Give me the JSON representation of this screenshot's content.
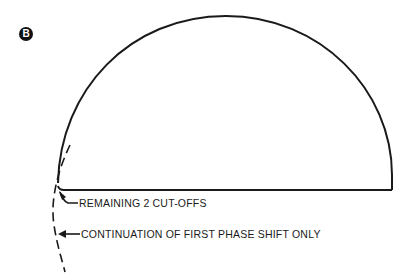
{
  "figure": {
    "panel_label": "B",
    "labels": {
      "remaining_cutoffs": "REMAINING 2  CUT-OFFS",
      "continuation": "CONTINUATION OF FIRST PHASE SHIFT ONLY"
    },
    "colors": {
      "line": "#1a1a1a",
      "background": "#ffffff"
    }
  }
}
